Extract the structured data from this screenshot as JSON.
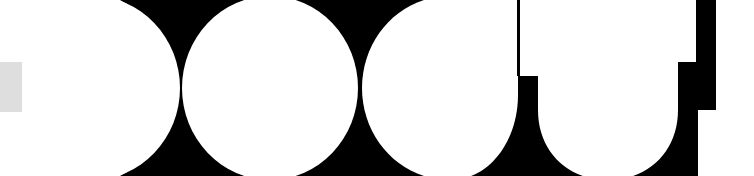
{
  "graphic": {
    "description": "Abstract high-contrast white shapes on black (cropped glyph-like forms)",
    "colors": {
      "background": "#000000",
      "foreground": "#ffffff",
      "accent_gray": "#dedede"
    },
    "shapes": [
      "left-blob",
      "circle-1",
      "circle-2",
      "u-shape-1",
      "u-shape-2"
    ]
  }
}
